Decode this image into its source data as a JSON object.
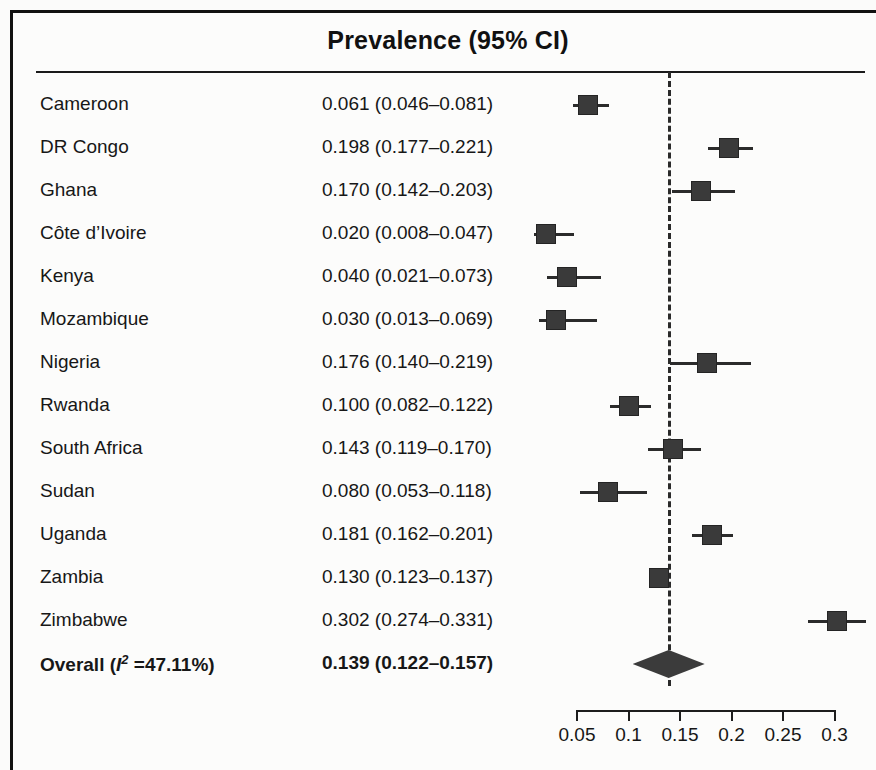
{
  "figure": {
    "title": "Prevalence (95% CI)",
    "type": "forest-plot"
  },
  "axis": {
    "tick_labels": [
      "0.05",
      "0.1",
      "0.15",
      "0.2",
      "0.25",
      "0.3"
    ],
    "tick_values": [
      0.05,
      0.1,
      0.15,
      0.2,
      0.25,
      0.3
    ]
  },
  "rows": [
    {
      "label": "Cameroon",
      "es_text": "0.061 (0.046–0.081)",
      "est": 0.061,
      "lo": 0.046,
      "hi": 0.081
    },
    {
      "label": "DR Congo",
      "es_text": "0.198 (0.177–0.221)",
      "est": 0.198,
      "lo": 0.177,
      "hi": 0.221
    },
    {
      "label": "Ghana",
      "es_text": "0.170 (0.142–0.203)",
      "est": 0.17,
      "lo": 0.142,
      "hi": 0.203
    },
    {
      "label": "Côte d’Ivoire",
      "es_text": "0.020 (0.008–0.047)",
      "est": 0.02,
      "lo": 0.008,
      "hi": 0.047
    },
    {
      "label": "Kenya",
      "es_text": "0.040 (0.021–0.073)",
      "est": 0.04,
      "lo": 0.021,
      "hi": 0.073
    },
    {
      "label": "Mozambique",
      "es_text": "0.030 (0.013–0.069)",
      "est": 0.03,
      "lo": 0.013,
      "hi": 0.069
    },
    {
      "label": "Nigeria",
      "es_text": "0.176 (0.140–0.219)",
      "est": 0.176,
      "lo": 0.14,
      "hi": 0.219
    },
    {
      "label": "Rwanda",
      "es_text": "0.100 (0.082–0.122)",
      "est": 0.1,
      "lo": 0.082,
      "hi": 0.122
    },
    {
      "label": "South Africa",
      "es_text": "0.143 (0.119–0.170)",
      "est": 0.143,
      "lo": 0.119,
      "hi": 0.17
    },
    {
      "label": "Sudan",
      "es_text": "0.080 (0.053–0.118)",
      "est": 0.08,
      "lo": 0.053,
      "hi": 0.118
    },
    {
      "label": "Uganda",
      "es_text": "0.181 (0.162–0.201)",
      "est": 0.181,
      "lo": 0.162,
      "hi": 0.201
    },
    {
      "label": "Zambia",
      "es_text": "0.130 (0.123–0.137)",
      "est": 0.13,
      "lo": 0.123,
      "hi": 0.137
    },
    {
      "label": "Zimbabwe",
      "es_text": "0.302 (0.274–0.331)",
      "est": 0.302,
      "lo": 0.274,
      "hi": 0.331
    }
  ],
  "overall": {
    "label_prefix": "Overall (",
    "label_i": "I",
    "label_sup": "2",
    "label_suffix": " =47.11%)",
    "heterogeneity_i2": "47.11%",
    "es_text": "0.139 (0.122–0.157)",
    "est": 0.139,
    "lo": 0.122,
    "hi": 0.157
  },
  "reference_line": {
    "value": 0.139,
    "style": "dashed"
  },
  "chart_data": {
    "type": "forest",
    "title": "Prevalence (95% CI)",
    "xlabel": "",
    "ylabel": "",
    "xlim": [
      0.05,
      0.3
    ],
    "grid": false,
    "legend": "none",
    "reference_line_value": 0.139,
    "categories": [
      "Cameroon",
      "DR Congo",
      "Ghana",
      "Côte d’Ivoire",
      "Kenya",
      "Mozambique",
      "Nigeria",
      "Rwanda",
      "South Africa",
      "Sudan",
      "Uganda",
      "Zambia",
      "Zimbabwe",
      "Overall"
    ],
    "values": [
      0.061,
      0.198,
      0.17,
      0.02,
      0.04,
      0.03,
      0.176,
      0.1,
      0.143,
      0.08,
      0.181,
      0.13,
      0.302,
      0.139
    ],
    "ci_lower": [
      0.046,
      0.177,
      0.142,
      0.008,
      0.021,
      0.013,
      0.14,
      0.082,
      0.119,
      0.053,
      0.162,
      0.123,
      0.274,
      0.122
    ],
    "ci_upper": [
      0.081,
      0.221,
      0.203,
      0.047,
      0.073,
      0.069,
      0.219,
      0.122,
      0.17,
      0.118,
      0.201,
      0.137,
      0.331,
      0.157
    ],
    "tick_labels": [
      "0.05",
      "0.1",
      "0.15",
      "0.2",
      "0.25",
      "0.3"
    ],
    "marker_color": "#3a3a3a",
    "line_color": "#2b2b2b"
  }
}
